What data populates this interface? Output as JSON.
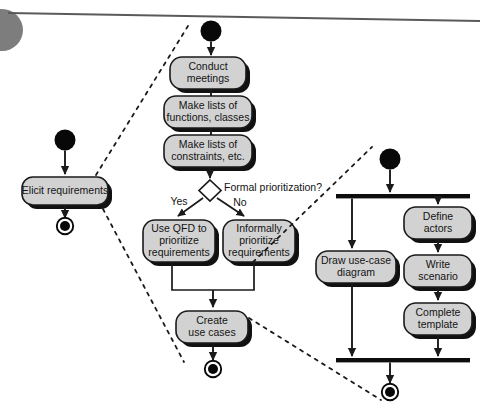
{
  "diagram": {
    "type": "uml-activity-diagram",
    "colors": {
      "node_fill": "#d2d2d2",
      "node_stroke": "#1a1a1a",
      "shadow": "#111111",
      "line": "#1a1a1a",
      "text": "#141414",
      "page_rule": "#5a5a5a",
      "corner_blob": "#7d7d7d",
      "background": "#ffffff"
    }
  },
  "decoration": {
    "page_rule_name": "page-top-rule",
    "corner_blob_name": "page-corner-blob"
  },
  "swimlanes": [
    {
      "id": "overview",
      "name": "overview-lane",
      "start_node_label": "",
      "final_node_label": ""
    },
    {
      "id": "elicitation",
      "name": "elicitation-lane"
    },
    {
      "id": "usecase",
      "name": "use-case-lane"
    }
  ],
  "nodes": {
    "elicit_requirements": {
      "label": "Elicit requirements",
      "lines": [
        "Elicit requirements"
      ]
    },
    "conduct_meetings": {
      "label": "Conduct meetings",
      "lines": [
        "Conduct",
        "meetings"
      ]
    },
    "make_lists_functions": {
      "label": "Make lists of functions, classes",
      "lines": [
        "Make lists of",
        "functions, classes"
      ]
    },
    "make_lists_constraints": {
      "label": "Make lists of constraints, etc.",
      "lines": [
        "Make lists of",
        "constraints, etc."
      ]
    },
    "use_qfd": {
      "label": "Use QFD to prioritize requirements",
      "lines": [
        "Use QFD to",
        "prioritize",
        "requirements"
      ]
    },
    "informally_prioritize": {
      "label": "Informally prioritize requirements",
      "lines": [
        "Informally",
        "prioritize",
        "requirements"
      ]
    },
    "create_use_cases": {
      "label": "Create use cases",
      "lines": [
        "Create",
        "use cases"
      ]
    },
    "draw_use_case_diagram": {
      "label": "Draw use-case diagram",
      "lines": [
        "Draw use-case",
        "diagram"
      ]
    },
    "define_actors": {
      "label": "Define actors",
      "lines": [
        "Define",
        "actors"
      ]
    },
    "write_scenario": {
      "label": "Write scenario",
      "lines": [
        "Write",
        "scenario"
      ]
    },
    "complete_template": {
      "label": "Complete template",
      "lines": [
        "Complete",
        "template"
      ]
    }
  },
  "decision": {
    "label": "Formal prioritization?",
    "guards": {
      "yes": "Yes",
      "no": "No"
    }
  },
  "control_nodes": {
    "start_overview": "initial-node",
    "final_overview": "final-node",
    "start_elicitation": "initial-node",
    "final_elicitation": "final-node",
    "start_usecase": "initial-node",
    "final_usecase": "final-node",
    "fork_usecase": "fork-bar",
    "join_usecase": "join-bar",
    "merge_priority": "merge-point"
  }
}
